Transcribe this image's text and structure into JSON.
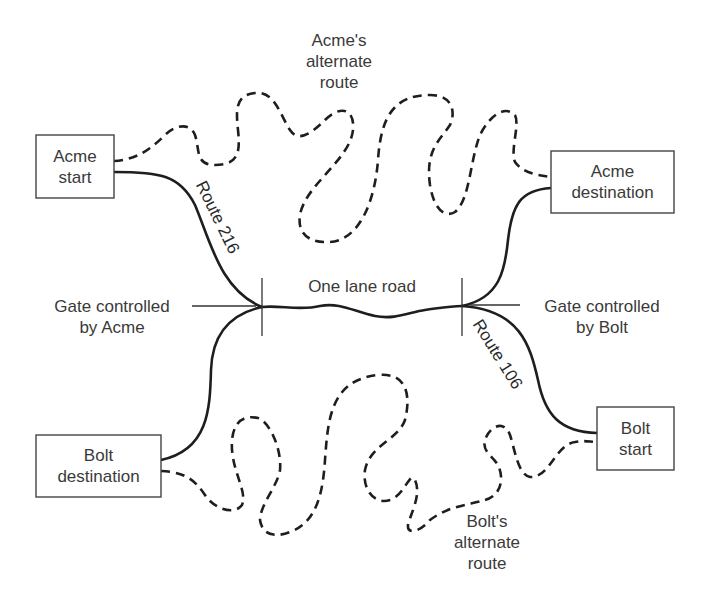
{
  "diagram": {
    "boxes": {
      "acme_start": {
        "line1": "Acme",
        "line2": "start"
      },
      "acme_destination": {
        "line1": "Acme",
        "line2": "destination"
      },
      "bolt_destination": {
        "line1": "Bolt",
        "line2": "destination"
      },
      "bolt_start": {
        "line1": "Bolt",
        "line2": "start"
      }
    },
    "labels": {
      "acme_alt_route": {
        "line1": "Acme's",
        "line2": "alternate",
        "line3": "route"
      },
      "bolt_alt_route": {
        "line1": "Bolt's",
        "line2": "alternate",
        "line3": "route"
      },
      "one_lane_road": "One lane road",
      "gate_acme": {
        "line1": "Gate controlled",
        "line2": "by Acme"
      },
      "gate_bolt": {
        "line1": "Gate controlled",
        "line2": "by Bolt"
      },
      "route_216": "Route 216",
      "route_106": "Route 106"
    },
    "legend": {
      "solid_line": "main road",
      "dashed_line": "alternate route"
    },
    "colors": {
      "line": "#1e1e1e",
      "text": "#3a3a3a",
      "background": "#ffffff"
    }
  }
}
